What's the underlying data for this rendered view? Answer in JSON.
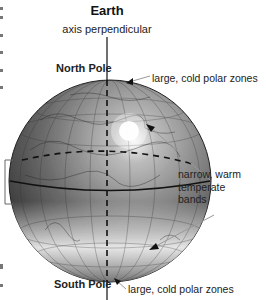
{
  "title": "Earth",
  "axis_label": "axis perpendicular",
  "labels": {
    "north_pole": "North Pole",
    "south_pole": "South Pole",
    "polar_top": "large, cold polar zones",
    "temperate": [
      "narrow, warm",
      "temperate",
      "bands"
    ],
    "polar_bottom": "large, cold polar zones"
  },
  "colors": {
    "globe_dark": "#2a2a2a",
    "globe_light": "#f4f4f4",
    "line": "#111111",
    "pointer": "#999999"
  }
}
